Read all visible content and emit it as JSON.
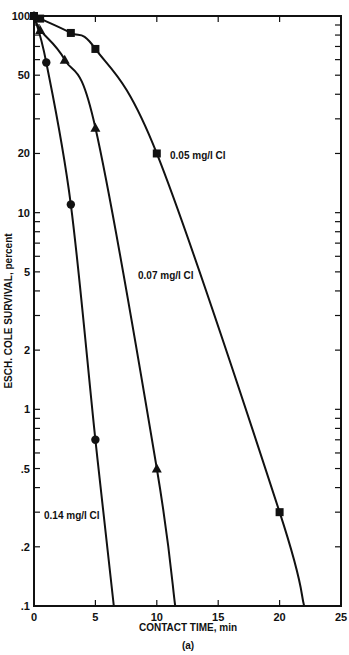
{
  "chart_data": {
    "type": "line",
    "title": "",
    "caption": "(a)",
    "xlabel": "CONTACT TIME, min",
    "ylabel": "ESCH. COLE SURVIVAL, percent",
    "xlim": [
      0,
      25
    ],
    "ylim": [
      0.1,
      100
    ],
    "yscale": "log",
    "grid": false,
    "x_ticks": [
      "0",
      "5",
      "10",
      "15",
      "20",
      "25"
    ],
    "y_ticks": [
      "100",
      "50",
      "20",
      "10",
      "5",
      "2",
      "1",
      ".5",
      ".2",
      ".1"
    ],
    "series": [
      {
        "name": "0.05 mg/l Cl",
        "marker": "square",
        "points": [
          [
            0,
            100
          ],
          [
            0.5,
            97
          ],
          [
            3,
            82
          ],
          [
            5,
            68
          ],
          [
            10,
            20
          ],
          [
            20,
            0.3
          ]
        ],
        "curve_end": [
          22,
          0.1
        ]
      },
      {
        "name": "0.07 mg/l Cl",
        "marker": "triangle",
        "points": [
          [
            0,
            100
          ],
          [
            0.5,
            85
          ],
          [
            2.5,
            60
          ],
          [
            5,
            27
          ],
          [
            10,
            0.5
          ]
        ],
        "curve_end": [
          11.5,
          0.1
        ]
      },
      {
        "name": "0.14 mg/l Cl",
        "marker": "circle",
        "points": [
          [
            0,
            100
          ],
          [
            1,
            58
          ],
          [
            3,
            11
          ],
          [
            5,
            0.7
          ]
        ],
        "curve_end": [
          6.5,
          0.1
        ]
      }
    ],
    "annotations": [
      {
        "text": "0.05 mg/l Cl",
        "near": [
          11,
          20
        ]
      },
      {
        "text": "0.07 mg/l Cl",
        "near": [
          6,
          3.5
        ]
      },
      {
        "text": "0.14 mg/l Cl",
        "near": [
          0.5,
          0.3
        ]
      }
    ]
  }
}
